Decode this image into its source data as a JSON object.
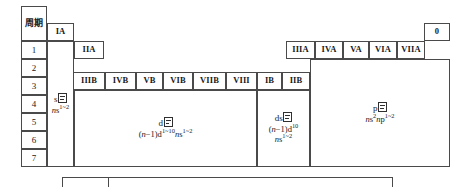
{
  "diagram": {
    "title_cell": "周期",
    "periods": [
      "1",
      "2",
      "3",
      "4",
      "5",
      "6",
      "7"
    ],
    "groups_a_left": [
      "IA",
      "IIA"
    ],
    "groups_b": [
      "IIIB",
      "IVB",
      "VB",
      "VIB",
      "VIIB",
      "VIII",
      "IB",
      "IIB"
    ],
    "groups_a_right": [
      "IIIA",
      "IVA",
      "VA",
      "VIA",
      "VIIA"
    ],
    "group_zero": "0",
    "blocks": [
      {
        "id": "s-block",
        "name_prefix": "s",
        "name_suffix": "区",
        "config_lines": [
          "ns1~2"
        ]
      },
      {
        "id": "d-block",
        "name_prefix": "d",
        "name_suffix": "区",
        "config_lines": [
          "(n-1)d1~10ns1~2"
        ]
      },
      {
        "id": "ds-block",
        "name_prefix": "ds",
        "name_suffix": "区",
        "config_lines": [
          "(n-1)d10",
          "ns1~2"
        ]
      },
      {
        "id": "p-block",
        "name_prefix": "p",
        "name_suffix": "区",
        "config_lines": [
          "ns2np1~2"
        ]
      }
    ],
    "colors": {
      "border": "#4a4a4a",
      "text": "#1a1a1a",
      "background": "#ffffff"
    }
  }
}
